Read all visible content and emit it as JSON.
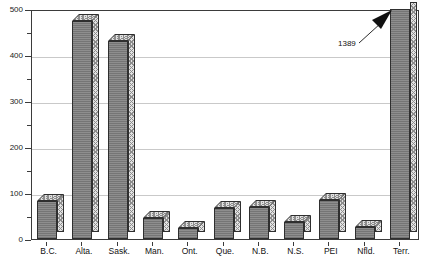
{
  "chart_data": {
    "type": "bar",
    "title": "",
    "subtitle": "",
    "xlabel": "",
    "ylabel": "",
    "categories": [
      "B.C.",
      "Alta.",
      "Sask.",
      "Man.",
      "Ont.",
      "Que.",
      "N.B.",
      "N.S.",
      "PEI",
      "Nfld.",
      "Terr."
    ],
    "values": [
      82,
      475,
      430,
      45,
      25,
      68,
      70,
      38,
      85,
      27,
      1389
    ],
    "ylim": [
      0,
      500
    ],
    "y_ticks_major": [
      0,
      100,
      200,
      300,
      400,
      500
    ],
    "y_tick_labels": [
      "0",
      "100",
      "200",
      "300",
      "400",
      "500"
    ],
    "y_ticks_minor": [
      50,
      150,
      250,
      350,
      450
    ],
    "grid": "horizontal",
    "legend": "none",
    "annotations": [
      {
        "text": "1389",
        "target_category": "Terr.",
        "note": "arrow pointing up-right to the Terr. bar which is clipped at the top of the axis"
      }
    ],
    "clipped_bars": [
      "Terr."
    ],
    "colors": {
      "bar_front": "#8e8e8e",
      "bar_top": "#e0e0e0",
      "bar_side": "#e3e3e3",
      "bar_outline": "#2f2f2f",
      "gridline": "#c9c9c9",
      "axis": "#3b3b3b",
      "text": "#111111",
      "background": "#ffffff"
    }
  }
}
